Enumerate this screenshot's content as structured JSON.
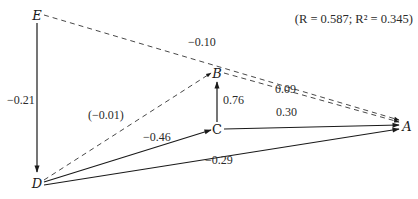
{
  "title_fragment": "",
  "stats": "(R = 0.587; R² = 0.345)",
  "nodes": {
    "E": {
      "label": "E",
      "x": 37,
      "y": 18
    },
    "D": {
      "label": "D",
      "x": 37,
      "y": 186
    },
    "B": {
      "label": "B",
      "x": 217,
      "y": 76
    },
    "C": {
      "label": "C",
      "x": 217,
      "y": 129
    },
    "A": {
      "label": "A",
      "x": 405,
      "y": 127
    }
  },
  "edges": [
    {
      "from": "E",
      "to": "D",
      "style": "solid",
      "label": "−0.21"
    },
    {
      "from": "E",
      "to": "A",
      "style": "dashed",
      "label": "−0.10"
    },
    {
      "from": "D",
      "to": "B",
      "style": "dashed",
      "label": "(−0.01)"
    },
    {
      "from": "B",
      "to": "A",
      "style": "dashed",
      "label": "0.09"
    },
    {
      "from": "C",
      "to": "B",
      "style": "solid",
      "label": "0.76"
    },
    {
      "from": "D",
      "to": "C",
      "style": "solid",
      "label": "−0.46"
    },
    {
      "from": "C",
      "to": "A",
      "style": "solid",
      "label": "0.30"
    },
    {
      "from": "D",
      "to": "A",
      "style": "solid",
      "label": "−0.29"
    }
  ]
}
